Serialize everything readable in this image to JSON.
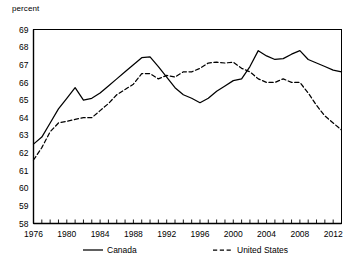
{
  "axis_unit_label": "percent",
  "legend": {
    "items": [
      {
        "label": "Canada",
        "style": "solid"
      },
      {
        "label": "United States",
        "style": "dashed"
      }
    ]
  },
  "chart_data": {
    "type": "line",
    "title": "",
    "subtitle": "",
    "xlabel": "",
    "ylabel": "percent",
    "ylim": [
      58,
      69
    ],
    "xlim": [
      1976,
      2013
    ],
    "grid": false,
    "legend_position": "bottom",
    "ytick_labels": [
      "58",
      "59",
      "60",
      "61",
      "62",
      "63",
      "64",
      "65",
      "66",
      "67",
      "68",
      "69"
    ],
    "ytick_values": [
      58,
      59,
      60,
      61,
      62,
      63,
      64,
      65,
      66,
      67,
      68,
      69
    ],
    "xtick_labels": [
      "1976",
      "1980",
      "1984",
      "1988",
      "1992",
      "1996",
      "2000",
      "2004",
      "2008",
      "2012"
    ],
    "xtick_values": [
      1976,
      1980,
      1984,
      1988,
      1992,
      1996,
      2000,
      2004,
      2008,
      2012
    ],
    "x_minor_tick_interval": 1,
    "x": [
      1976,
      1977,
      1978,
      1979,
      1980,
      1981,
      1982,
      1983,
      1984,
      1985,
      1986,
      1987,
      1988,
      1989,
      1990,
      1991,
      1992,
      1993,
      1994,
      1995,
      1996,
      1997,
      1998,
      1999,
      2000,
      2001,
      2002,
      2003,
      2004,
      2005,
      2006,
      2007,
      2008,
      2009,
      2010,
      2011,
      2012,
      2013
    ],
    "series": [
      {
        "name": "Canada",
        "style": "solid",
        "values": [
          62.5,
          62.9,
          63.7,
          64.5,
          65.1,
          65.7,
          65.0,
          65.1,
          65.4,
          65.8,
          66.2,
          66.6,
          67.0,
          67.4,
          67.45,
          66.9,
          66.3,
          65.7,
          65.3,
          65.1,
          64.85,
          65.1,
          65.5,
          65.8,
          66.1,
          66.2,
          66.9,
          67.8,
          67.5,
          67.3,
          67.35,
          67.6,
          67.8,
          67.3,
          67.1,
          66.9,
          66.7,
          66.6
        ]
      },
      {
        "name": "United States",
        "style": "dashed",
        "values": [
          61.6,
          62.3,
          63.2,
          63.7,
          63.8,
          63.9,
          64.0,
          64.0,
          64.4,
          64.8,
          65.3,
          65.6,
          65.9,
          66.5,
          66.5,
          66.2,
          66.4,
          66.3,
          66.6,
          66.6,
          66.8,
          67.1,
          67.15,
          67.1,
          67.15,
          66.8,
          66.6,
          66.2,
          66.0,
          66.0,
          66.2,
          66.0,
          66.0,
          65.4,
          64.7,
          64.1,
          63.7,
          63.3
        ]
      }
    ]
  }
}
